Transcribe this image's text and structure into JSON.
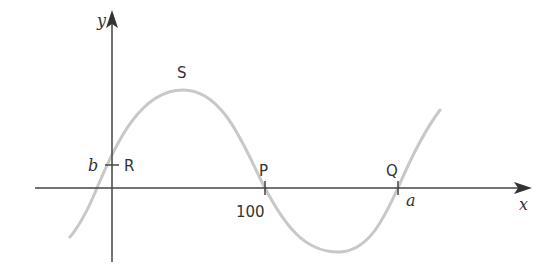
{
  "diagram": {
    "type": "sine-curve-graph",
    "axes": {
      "x_label": "x",
      "y_label": "y",
      "axis_color": "#444444"
    },
    "curve": {
      "color": "#c8c8c8",
      "description": "sinusoidal curve crossing y-axis at b, peak S, crossing x-axis at P and Q"
    },
    "points": {
      "R": "R",
      "S": "S",
      "P": "P",
      "Q": "Q"
    },
    "tick_labels": {
      "b": "b",
      "p_value": "100",
      "a": "a"
    }
  }
}
